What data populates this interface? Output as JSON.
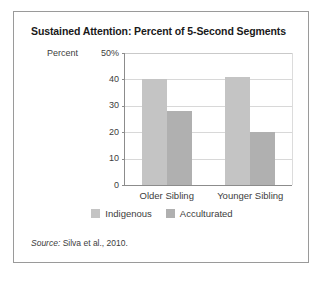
{
  "figure": {
    "title": "Sustained Attention: Percent of 5-Second Segments",
    "source_lead": "Source:",
    "source_text": " Silva et al., 2010."
  },
  "chart_data": {
    "type": "bar",
    "title": "Sustained Attention: Percent of 5-Second Segments",
    "xlabel": "",
    "ylabel": "Percent",
    "categories": [
      "Older Sibling",
      "Younger Sibling"
    ],
    "series": [
      {
        "name": "Indigenous",
        "color": "#c4c4c4",
        "values": [
          40,
          41
        ]
      },
      {
        "name": "Acculturated",
        "color": "#b0b0b0",
        "values": [
          28,
          20
        ]
      }
    ],
    "ylim": [
      0,
      50
    ],
    "yticks": [
      0,
      10,
      20,
      30,
      40,
      50
    ],
    "ytick_labels": [
      "0",
      "10",
      "20",
      "30",
      "40",
      "50%"
    ],
    "grid": "horizontal",
    "legend_position": "bottom-center"
  }
}
